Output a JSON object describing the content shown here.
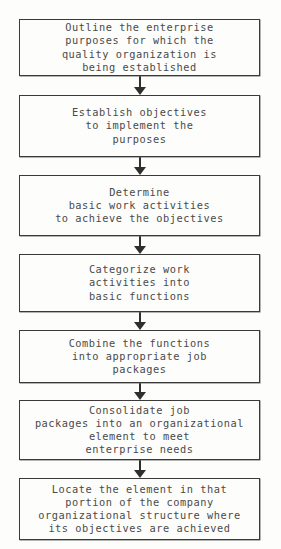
{
  "diagram": {
    "type": "flowchart",
    "orientation": "vertical",
    "title": "",
    "background_color": "#fdfdfb",
    "box_border_color": "#3a3a3a",
    "text_color": "#4a4a4a",
    "arrow_color": "#2f2f2f",
    "node_count": 7,
    "connector_count": 6,
    "nodes": [
      {
        "id": "node-1",
        "name": "outline-enterprise-purposes",
        "text": "Outline the enterprise\npurposes for which the\nquality organization is\nbeing established",
        "lines": [
          "Outline the enterprise",
          "purposes for which the",
          "quality organization is",
          "being established"
        ],
        "x": 19,
        "y": 19,
        "width": 241,
        "height": 57
      },
      {
        "id": "node-2",
        "name": "establish-objectives",
        "text": "Establish objectives\nto implement the\npurposes",
        "lines": [
          "Establish objectives",
          "to implement the",
          "purposes"
        ],
        "x": 19,
        "y": 95,
        "width": 241,
        "height": 62
      },
      {
        "id": "node-3",
        "name": "determine-basic-work-activities",
        "text": "Determine\nbasic work activities\nto achieve the objectives",
        "lines": [
          "Determine",
          "basic work activities",
          "to achieve the objectives"
        ],
        "x": 19,
        "y": 175,
        "width": 241,
        "height": 61
      },
      {
        "id": "node-4",
        "name": "categorize-work-activities",
        "text": "Categorize work\nactivities into\nbasic functions",
        "lines": [
          "Categorize work",
          "activities into",
          "basic functions"
        ],
        "x": 19,
        "y": 254,
        "width": 241,
        "height": 58
      },
      {
        "id": "node-5",
        "name": "combine-functions-into-job-packages",
        "text": "Combine the functions\ninto appropriate job\npackages",
        "lines": [
          "Combine the functions",
          "into appropriate job",
          "packages"
        ],
        "x": 19,
        "y": 330,
        "width": 241,
        "height": 53
      },
      {
        "id": "node-6",
        "name": "consolidate-job-packages",
        "text": "Consolidate job\npackages into an organizational\nelement to meet\nenterprise needs",
        "lines": [
          "Consolidate job",
          "packages into an organizational",
          "element to meet",
          "enterprise needs"
        ],
        "x": 19,
        "y": 400,
        "width": 241,
        "height": 60
      },
      {
        "id": "node-7",
        "name": "locate-element-in-company-structure",
        "text": "Locate the element in that\nportion of the company\norganizational structure where\nits objectives are achieved",
        "lines": [
          "Locate the element in that",
          "portion of the company",
          "organizational structure where",
          "its objectives are achieved"
        ],
        "x": 19,
        "y": 478,
        "width": 241,
        "height": 62
      }
    ],
    "connectors": [
      {
        "id": "connector-1",
        "name": "arrow-node1-to-node2",
        "from": "node-1",
        "to": "node-2",
        "x": 140,
        "y": 76,
        "length": 19,
        "direction": "down"
      },
      {
        "id": "connector-2",
        "name": "arrow-node2-to-node3",
        "from": "node-2",
        "to": "node-3",
        "x": 140,
        "y": 157,
        "length": 18,
        "direction": "down"
      },
      {
        "id": "connector-3",
        "name": "arrow-node3-to-node4",
        "from": "node-3",
        "to": "node-4",
        "x": 140,
        "y": 236,
        "length": 18,
        "direction": "down"
      },
      {
        "id": "connector-4",
        "name": "arrow-node4-to-node5",
        "from": "node-4",
        "to": "node-5",
        "x": 140,
        "y": 312,
        "length": 18,
        "direction": "down"
      },
      {
        "id": "connector-5",
        "name": "arrow-node5-to-node6",
        "from": "node-5",
        "to": "node-6",
        "x": 140,
        "y": 383,
        "length": 17,
        "direction": "down"
      },
      {
        "id": "connector-6",
        "name": "arrow-node6-to-node7",
        "from": "node-6",
        "to": "node-7",
        "x": 140,
        "y": 460,
        "length": 18,
        "direction": "down"
      }
    ]
  }
}
